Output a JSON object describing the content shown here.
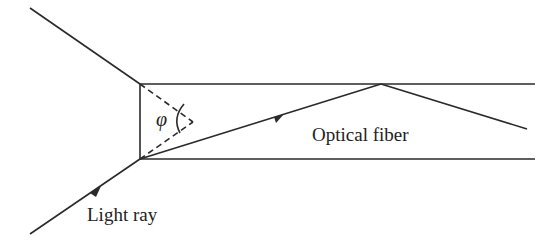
{
  "diagram": {
    "labels": {
      "phi": "φ",
      "fiber": "Optical fiber",
      "ray": "Light ray"
    },
    "colors": {
      "stroke": "#2a2a2a",
      "background": "#ffffff"
    }
  }
}
